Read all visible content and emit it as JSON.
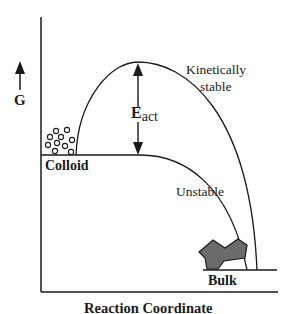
{
  "diagram": {
    "y_axis_label": "G",
    "x_axis_label": "Reaction Coordinate",
    "states": {
      "colloid": "Colloid",
      "bulk": "Bulk"
    },
    "curves": {
      "upper": "Kinetically",
      "upper_line2": "stable",
      "lower": "Unstable"
    },
    "barrier": {
      "symbol": "E",
      "subscript": "act"
    },
    "colors": {
      "line": "#1a1a1a",
      "bulk_fill": "#6b6b6b"
    }
  }
}
